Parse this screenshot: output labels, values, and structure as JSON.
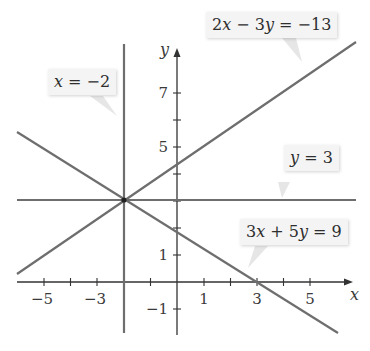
{
  "figure": {
    "type": "system-of-linear-equations-graph",
    "axes": {
      "x_label": "x",
      "y_label": "y",
      "x_tick_labels": [
        "−5",
        "−3",
        "1",
        "3",
        "5"
      ],
      "x_tick_values": [
        -5,
        -3,
        1,
        3,
        5
      ],
      "x_minor_ticks": [
        -6,
        -5,
        -4,
        -3,
        -2,
        -1,
        1,
        2,
        3,
        4,
        5
      ],
      "y_tick_labels": [
        "−1",
        "1",
        "5",
        "7"
      ],
      "y_tick_values": [
        -1,
        1,
        5,
        7
      ],
      "y_minor_ticks": [
        -1,
        1,
        2,
        3,
        4,
        5,
        6,
        7
      ],
      "x_range": [
        -6.1,
        6.7
      ],
      "y_range": [
        -1.8,
        8.9
      ]
    },
    "lines": [
      {
        "label": "x = −2",
        "equation": "x = -2",
        "kind": "vertical"
      },
      {
        "label": "2x − 3y = −13",
        "equation": "2x - 3y = -13",
        "kind": "slanted"
      },
      {
        "label": "y = 3",
        "equation": "y = 3",
        "kind": "horizontal"
      },
      {
        "label": "3x + 5y = 9",
        "equation": "3x + 5y = 9",
        "kind": "slanted"
      }
    ],
    "intersection_point": {
      "x": -2,
      "y": 3
    },
    "colors": {
      "line": "#6e6e6e",
      "axis": "#333333",
      "callout_bg": "#f4f4f4",
      "text": "#2e2e2e"
    }
  },
  "labels": {
    "x_eq_neg2": {
      "var": "x",
      "rest": " = −2"
    },
    "eq_2x_3y": {
      "a": "2",
      "x": "x",
      "mid": " − 3",
      "y": "y",
      "rest": " = −13"
    },
    "y_eq_3": {
      "var": "y",
      "rest": " = 3"
    },
    "eq_3x_5y": {
      "a": "3",
      "x": "x",
      "mid": " + 5",
      "y": "y",
      "rest": " = 9"
    }
  }
}
